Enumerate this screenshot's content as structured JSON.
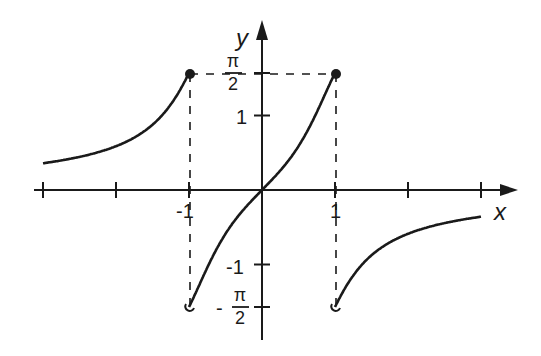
{
  "chart_data": {
    "type": "line",
    "title": "",
    "xlabel": "x",
    "ylabel": "y",
    "function": "y = arctan(x / (1 - x^2))",
    "xlim": [
      -3,
      3.4
    ],
    "ylim": [
      -2.1,
      2.2
    ],
    "grid": false,
    "x_ticks": [
      -3,
      -2,
      -1,
      0,
      1,
      2,
      3
    ],
    "x_tick_labels": [
      {
        "value": -1,
        "label": "-1"
      },
      {
        "value": 1,
        "label": "1"
      }
    ],
    "y_ticks": [
      1.5708,
      1,
      -1,
      -1.5708
    ],
    "y_tick_labels": [
      {
        "value": 1.5708,
        "label_num": "π",
        "label_den": "2",
        "sign": ""
      },
      {
        "value": 1,
        "label": "1"
      },
      {
        "value": -1,
        "label": "-1"
      },
      {
        "value": -1.5708,
        "label_num": "π",
        "label_den": "2",
        "sign": "-"
      }
    ],
    "series": [
      {
        "name": "branch-left",
        "x_range": [
          -3,
          -1
        ],
        "endpoint": {
          "x": -1,
          "y": 1.5708,
          "marker": "filled"
        }
      },
      {
        "name": "branch-middle",
        "x_range": [
          -1,
          1
        ],
        "start": {
          "x": -1,
          "y": -1.5708,
          "marker": "open"
        },
        "end": {
          "x": 1,
          "y": 1.5708,
          "marker": "filled"
        }
      },
      {
        "name": "branch-right",
        "x_range": [
          1,
          3
        ],
        "start": {
          "x": 1,
          "y": -1.5708,
          "marker": "open"
        }
      }
    ],
    "guides": [
      {
        "type": "dashed-horizontal",
        "y": 1.5708,
        "from_x": -1,
        "to_x": 1
      },
      {
        "type": "dashed-vertical",
        "x": -1,
        "from_y": -1.5708,
        "to_y": 1.5708
      },
      {
        "type": "dashed-vertical",
        "x": 1,
        "from_y": -1.5708,
        "to_y": 1.5708
      }
    ]
  },
  "labels": {
    "x_axis": "x",
    "y_axis": "y",
    "tick_neg1_x": "-1",
    "tick_pos1_x": "1",
    "tick_pos1_y": "1",
    "tick_neg1_y": "-1",
    "pi": "π",
    "two": "2",
    "minus": "-"
  },
  "colors": {
    "ink": "#1a1a1a",
    "background": "#ffffff"
  }
}
